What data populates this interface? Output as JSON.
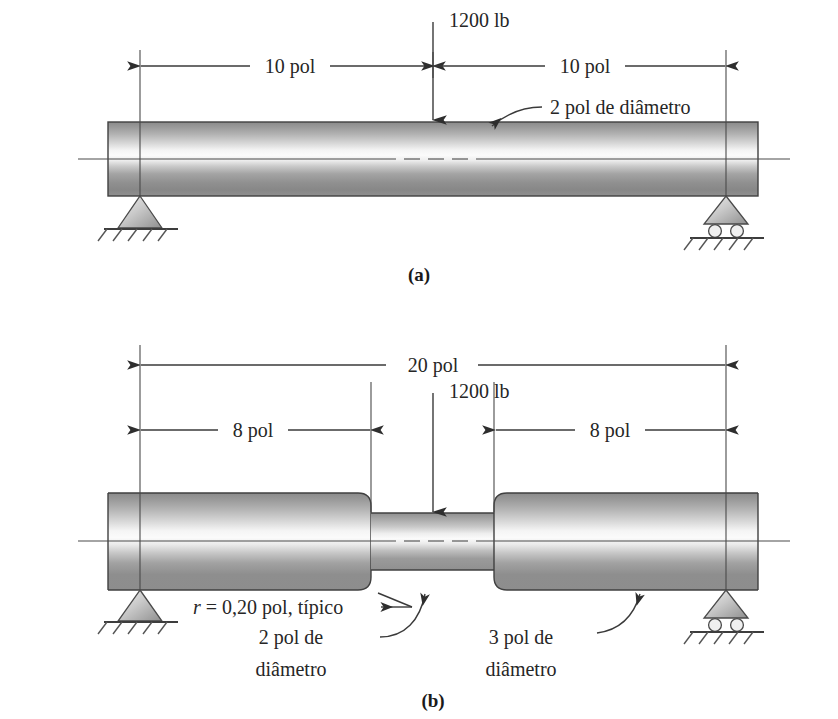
{
  "figure": {
    "kind": "engineering-beam-diagram",
    "language": "pt-BR",
    "units": "pol",
    "subfigures": [
      {
        "id": "a",
        "caption": "(a)",
        "description": "Eixo uniforme simplesmente apoiado com carga central",
        "load_label": "1200 lb",
        "load_value": 1200,
        "load_units": "lb",
        "diameter_callout": "2 pol de diâmetro",
        "dimensions": [
          {
            "label": "10 pol",
            "value": 10
          },
          {
            "label": "10 pol",
            "value": 10
          }
        ],
        "supports": [
          {
            "type": "pin",
            "position": "left"
          },
          {
            "type": "roller",
            "position": "right"
          }
        ]
      },
      {
        "id": "b",
        "caption": "(b)",
        "description": "Eixo escalonado com rebaixo central e raios de concordância",
        "load_label": "1200 lb",
        "load_value": 1200,
        "load_units": "lb",
        "overall_dimension": {
          "label": "20 pol",
          "value": 20
        },
        "dimensions": [
          {
            "label": "8 pol",
            "value": 8
          },
          {
            "label": "8 pol",
            "value": 8
          }
        ],
        "fillet_callout": {
          "symbol": "r",
          "rest": " = 0,20 pol, típico",
          "value": 0.2
        },
        "small_diameter_callout": {
          "line1": "2 pol de",
          "line2": "diâmetro",
          "value": 2
        },
        "large_diameter_callout": {
          "line1": "3 pol de",
          "line2": "diâmetro",
          "value": 3
        },
        "supports": [
          {
            "type": "pin",
            "position": "left"
          },
          {
            "type": "roller",
            "position": "right"
          }
        ]
      }
    ]
  },
  "colors": {
    "ink": "#2e2e2e",
    "line": "#3a3a3a",
    "shaft_dark": "#7d7d7d",
    "shaft_mid": "#a8a8a8",
    "shaft_light": "#f2f2f2",
    "background": "#ffffff"
  }
}
